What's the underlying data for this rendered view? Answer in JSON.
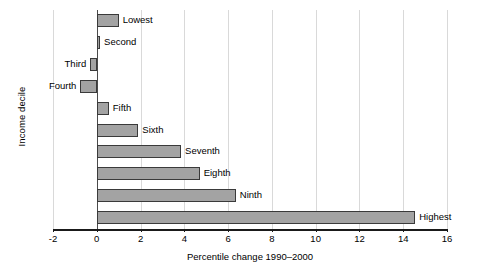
{
  "chart_data": {
    "type": "bar",
    "orientation": "horizontal",
    "title": "",
    "xlabel": "Percentile change 1990–2000",
    "ylabel": "Income decile",
    "categories": [
      "Lowest",
      "Second",
      "Third",
      "Fourth",
      "Fifth",
      "Sixth",
      "Seventh",
      "Eighth",
      "Ninth",
      "Highest"
    ],
    "values": [
      1.0,
      0.15,
      -0.3,
      -0.75,
      0.55,
      1.9,
      3.85,
      4.7,
      6.35,
      14.55
    ],
    "xlim": [
      -2,
      16
    ],
    "xticks": [
      -2,
      0,
      2,
      4,
      6,
      8,
      10,
      12,
      14,
      16
    ],
    "xtick_labels": [
      "-2",
      "0",
      "2",
      "4",
      "6",
      "8",
      "10",
      "12",
      "14",
      "16"
    ],
    "grid": "vertical",
    "legend": "none",
    "bar_fill": "#a3a3a3",
    "bar_edge": "#3a3a3a",
    "gridline_color": "#d9d9d9",
    "axis_color": "#1a1a1a"
  }
}
